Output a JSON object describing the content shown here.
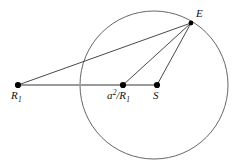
{
  "figure": {
    "type": "geometry-diagram",
    "width": 240,
    "height": 168,
    "background_color": "#ffffff"
  },
  "colors": {
    "circle_stroke": "#555555",
    "ray_stroke": "#333333",
    "baseline_stroke": "#9a9a9a",
    "dot_fill": "#000000",
    "label_color": "#111111"
  },
  "circle": {
    "name": "main-circle",
    "cx": 154,
    "cy": 85,
    "r": 74,
    "stroke_width": 0.9
  },
  "points": [
    {
      "id": "R1",
      "name": "point-r1",
      "x": 18,
      "y": 85,
      "dot_radius": 3.1,
      "label": "R",
      "label_sub": "1",
      "label_sup": "",
      "label_x": 11,
      "label_y": 90
    },
    {
      "id": "a2R1",
      "name": "point-a-squared-over-r1",
      "x": 123,
      "y": 85,
      "dot_radius": 3.1,
      "label": "a",
      "label_sup": "2",
      "label_mid": "/R",
      "label_sub": "1",
      "label_x": 107,
      "label_y": 90
    },
    {
      "id": "S",
      "name": "point-s",
      "x": 157,
      "y": 85,
      "dot_radius": 3.1,
      "label": "S",
      "label_sub": "",
      "label_sup": "",
      "label_x": 153,
      "label_y": 90
    },
    {
      "id": "E",
      "name": "point-e",
      "x": 191,
      "y": 23,
      "dot_radius": 2.4,
      "label": "E",
      "label_sub": "",
      "label_sup": "",
      "label_x": 196,
      "label_y": 8
    }
  ],
  "baseline": {
    "name": "baseline-segment",
    "from": "R1",
    "to": "S",
    "x1": 18,
    "y1": 85,
    "x2": 157,
    "y2": 85,
    "stroke_width": 2.2
  },
  "rays": [
    {
      "name": "segment-e-to-r1",
      "from": "E",
      "to": "R1",
      "x1": 191,
      "y1": 23,
      "x2": 18,
      "y2": 85,
      "stroke_width": 0.9
    },
    {
      "name": "segment-e-to-a2r1",
      "from": "E",
      "to": "a2R1",
      "x1": 191,
      "y1": 23,
      "x2": 123,
      "y2": 85,
      "stroke_width": 0.9
    },
    {
      "name": "segment-e-to-s",
      "from": "E",
      "to": "S",
      "x1": 191,
      "y1": 23,
      "x2": 157,
      "y2": 85,
      "stroke_width": 0.9
    }
  ],
  "labels": {
    "R1_full": "R1",
    "a2R1_full": "a2/R1",
    "S_full": "S",
    "E_full": "E"
  }
}
